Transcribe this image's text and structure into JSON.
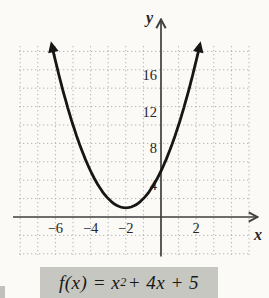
{
  "caption": {
    "lead": "f",
    "open": "(x) = x",
    "exponent": "2",
    "tail": " + 4x + 5"
  },
  "chart_data": {
    "type": "line",
    "title": "",
    "function": {
      "name": "f",
      "expression": "f(x) = x^2 + 4x + 5",
      "coefficients": [
        1,
        4,
        5
      ],
      "vertex": [
        -2,
        1
      ],
      "y_intercept": [
        0,
        5
      ]
    },
    "x_drawn_range": [
      -6.2,
      2.2
    ],
    "xlabel": "x",
    "ylabel": "y",
    "x_ticks": [
      -6,
      -4,
      -2,
      2
    ],
    "x_tick_labels": [
      "−6",
      "−4",
      "−2",
      "2"
    ],
    "y_ticks": [
      4,
      8,
      12,
      16
    ],
    "y_tick_labels": [
      "4",
      "8",
      "12",
      "16"
    ],
    "xlim": [
      -8.2,
      5.5
    ],
    "ylim": [
      -4.3,
      19.3
    ],
    "grid": true,
    "grid_style": "dotted",
    "grid_x_step": 1,
    "grid_y_step": 2,
    "legend_position": "none",
    "curve_color": "#161616",
    "axis_color": "#3e3e3e",
    "grid_color": "#b4b4ae",
    "label_color": "#26262a"
  }
}
